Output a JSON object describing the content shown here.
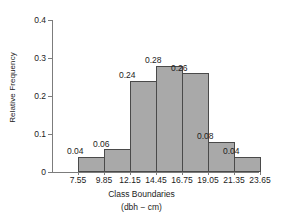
{
  "chart_data": {
    "type": "bar",
    "title": "",
    "xlabel": "Class Boundaries",
    "xlabel_sub": "(dbh − cm)",
    "ylabel": "Relative Frequency",
    "ylim": [
      0,
      0.4
    ],
    "ytick_labels": [
      "0",
      "0.1",
      "0.2",
      "0.3",
      "0.4"
    ],
    "ytick_values": [
      0,
      0.1,
      0.2,
      0.3,
      0.4
    ],
    "grid": false,
    "legend": null,
    "bin_edges": [
      7.55,
      9.85,
      12.15,
      14.45,
      16.75,
      19.05,
      21.35,
      23.65
    ],
    "xtick_labels": [
      "7.55",
      "9.85",
      "12.15",
      "14.45",
      "16.75",
      "19.05",
      "21.35",
      "23.65"
    ],
    "categories": [
      "7.55-9.85",
      "9.85-12.15",
      "12.15-14.45",
      "14.45-16.75",
      "16.75-19.05",
      "19.05-21.35",
      "21.35-23.65"
    ],
    "values": [
      0.04,
      0.06,
      0.24,
      0.28,
      0.26,
      0.08,
      0.04
    ],
    "data_labels": [
      "0.04",
      "0.06",
      "0.24",
      "0.28",
      "0.26",
      "0.08",
      "0.04"
    ],
    "bar_color": "#a9a9a9",
    "bar_edge_color": "#4a4a4a",
    "axis_color": "#7c7c7c",
    "text_color": "#1c1c1c"
  }
}
